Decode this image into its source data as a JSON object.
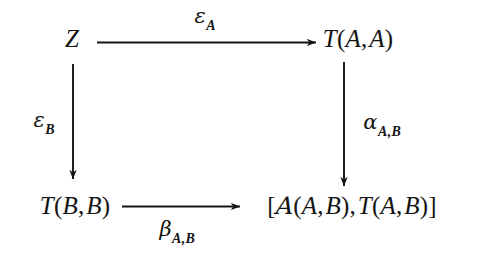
{
  "diagram": {
    "type": "commutative-square",
    "background_color": "#ffffff",
    "ink_color": "#141414",
    "nodes": [
      {
        "id": "top-left",
        "name": "node-z",
        "label": "Z",
        "parts": {
          "main": "Z"
        }
      },
      {
        "id": "top-right",
        "name": "node-t-a-a",
        "label": "T(A, A)",
        "parts": {
          "functor": "T",
          "open": "(",
          "arg1": "A",
          "comma": ",",
          "arg2": "A",
          "close": ")"
        }
      },
      {
        "id": "bottom-left",
        "name": "node-t-b-b",
        "label": "T(B, B)",
        "parts": {
          "functor": "T",
          "open": "(",
          "arg1": "B",
          "comma": ",",
          "arg2": "B",
          "close": ")"
        }
      },
      {
        "id": "bottom-right",
        "name": "node-hom-bracket",
        "label": "[A(A, B), T(A, B)]",
        "parts": {
          "open_bracket": "[",
          "category": "A",
          "open1": "(",
          "cat_arg1": "A",
          "comma1": ",",
          "cat_arg2": "B",
          "close1": ")",
          "comma_mid": ",",
          "functor": "T",
          "open2": "(",
          "fun_arg1": "A",
          "comma2": ",",
          "fun_arg2": "B",
          "close2": ")",
          "close_bracket": "]"
        }
      }
    ],
    "arrows": [
      {
        "id": "top",
        "name": "arrow-top-horizontal",
        "from": "top-left",
        "to": "top-right",
        "direction": "right",
        "label_base": "ε",
        "label_sub": "A",
        "label_position": "above"
      },
      {
        "id": "left",
        "name": "arrow-left-vertical",
        "from": "top-left",
        "to": "bottom-left",
        "direction": "down",
        "label_base": "ε",
        "label_sub": "B",
        "label_position": "left"
      },
      {
        "id": "right",
        "name": "arrow-right-vertical",
        "from": "top-right",
        "to": "bottom-right",
        "direction": "down",
        "label_base": "α",
        "label_sub": "A,B",
        "label_position": "right"
      },
      {
        "id": "bottom",
        "name": "arrow-bottom-horizontal",
        "from": "bottom-left",
        "to": "bottom-right",
        "direction": "right",
        "label_base": "β",
        "label_sub": "A,B",
        "label_position": "below"
      }
    ]
  }
}
